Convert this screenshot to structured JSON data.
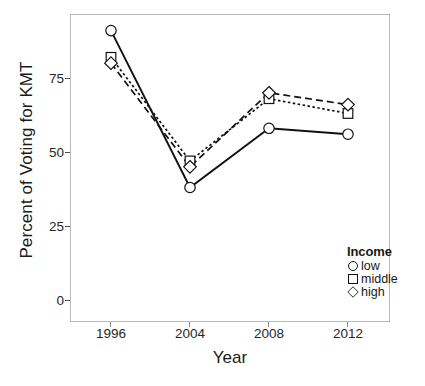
{
  "chart_data": {
    "type": "line",
    "title": "",
    "xlabel": "Year",
    "ylabel": "Percent of Voting for KMT",
    "x": [
      "1996",
      "2004",
      "2008",
      "2012"
    ],
    "xtick_labels": [
      "1996",
      "2004",
      "2008",
      "2012"
    ],
    "ytick_labels": [
      "0",
      "25",
      "50",
      "75"
    ],
    "ytick_values": [
      0,
      25,
      50,
      75
    ],
    "ylim": [
      0,
      100
    ],
    "grid": false,
    "legend_position": "inside-bottom-right",
    "legend_title": "Income",
    "series": [
      {
        "name": "low",
        "marker": "circle",
        "line_style": "solid",
        "values": [
          91,
          38,
          58,
          56
        ]
      },
      {
        "name": "middle",
        "marker": "square",
        "line_style": "dotted",
        "values": [
          82,
          47,
          68,
          63
        ]
      },
      {
        "name": "high",
        "marker": "diamond",
        "line_style": "dashed",
        "values": [
          80,
          45,
          70,
          66
        ]
      }
    ]
  },
  "axes": {
    "y_title": "Percent of Voting for KMT",
    "x_title": "Year",
    "y_ticks": [
      {
        "label": "75"
      },
      {
        "label": "50"
      },
      {
        "label": "25"
      },
      {
        "label": "0"
      }
    ],
    "x_ticks": [
      {
        "label": "1996"
      },
      {
        "label": "2004"
      },
      {
        "label": "2008"
      },
      {
        "label": "2012"
      }
    ]
  },
  "legend": {
    "title": "Income",
    "items": [
      {
        "label": "low",
        "marker": "circle-marker"
      },
      {
        "label": "middle",
        "marker": "square-marker"
      },
      {
        "label": "high",
        "marker": "diamond-marker"
      }
    ]
  },
  "colors": {
    "line": "#111111",
    "panel_border": "#b8b8b8",
    "text": "#1a1a1a",
    "background": "#ffffff"
  }
}
